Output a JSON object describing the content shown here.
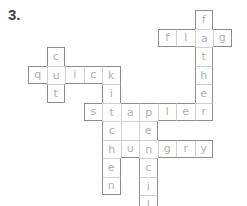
{
  "puzzle_number": "3.",
  "colors": {
    "outer_border": "#8c8c8c",
    "inner_border": "#d0d0d0",
    "letter": "#b0b0b0",
    "label": "#444444"
  },
  "grid": {
    "origin_x": 28,
    "origin_y": 10,
    "cell_size": 18.5
  },
  "words": [
    {
      "word": "flag",
      "direction": "across",
      "row": 1,
      "col": 7
    },
    {
      "word": "father",
      "direction": "down",
      "row": 0,
      "col": 9
    },
    {
      "word": "quick",
      "direction": "across",
      "row": 3,
      "col": 0
    },
    {
      "word": "cut",
      "direction": "down",
      "row": 2,
      "col": 1
    },
    {
      "word": "kitchen",
      "direction": "down",
      "row": 3,
      "col": 4
    },
    {
      "word": "stapler",
      "direction": "across",
      "row": 5,
      "col": 3
    },
    {
      "word": "pencil",
      "direction": "down",
      "row": 5,
      "col": 6
    },
    {
      "word": "hungry",
      "direction": "across",
      "row": 7,
      "col": 4
    }
  ],
  "empty_cells": [
    {
      "row": 6,
      "col": 5
    }
  ]
}
